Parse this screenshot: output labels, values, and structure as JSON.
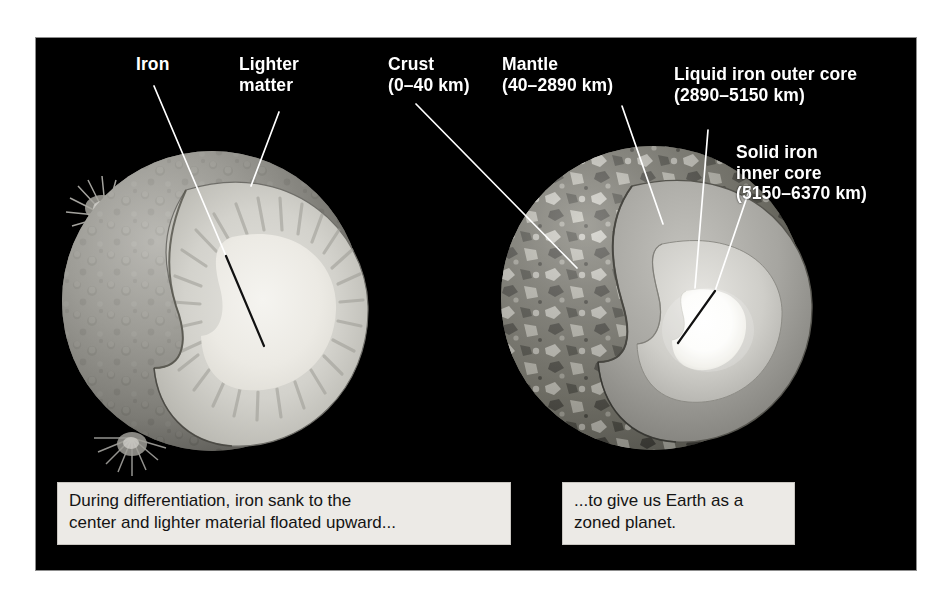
{
  "figure": {
    "background": "#ffffff",
    "panel_color": "#000000",
    "label_color": "#ffffff",
    "caption_bg": "#eceae6",
    "caption_text_color": "#141414"
  },
  "left_diagram": {
    "name": "differentiating-proto-earth",
    "labels": [
      {
        "id": "iron",
        "text": "Iron",
        "x": 100,
        "y": 24
      },
      {
        "id": "lighter-matter",
        "text": "Lighter\nmatter",
        "x": 203,
        "y": 24
      }
    ],
    "caption": "During differentiation, iron sank to the\ncenter and lighter material floated upward...",
    "layers": [
      {
        "name": "molten-cratered-surface",
        "color": "#8f8f8f"
      },
      {
        "name": "radial-streaked-mantle",
        "color": "#c9c9c4"
      },
      {
        "name": "bright-iron-core",
        "color": "#e9e9e4"
      }
    ]
  },
  "right_diagram": {
    "name": "zoned-earth",
    "labels": [
      {
        "id": "crust",
        "text": "Crust\n(0–40 km)",
        "x": 352,
        "y": 24
      },
      {
        "id": "mantle",
        "text": "Mantle\n(40–2890 km)",
        "x": 466,
        "y": 24
      },
      {
        "id": "outer-core",
        "text": "Liquid iron outer core\n(2890–5150 km)",
        "x": 638,
        "y": 32
      },
      {
        "id": "inner-core",
        "text": "Solid iron\ninner core\n(5150–6370 km)",
        "x": 700,
        "y": 110
      }
    ],
    "caption": "...to give us Earth as a\nzoned planet.",
    "layers": [
      {
        "name": "crust",
        "range_km": "0–40",
        "color": "#9a9a9a"
      },
      {
        "name": "mantle",
        "range_km": "40–2890",
        "color": "#a8a8a8"
      },
      {
        "name": "liquid-iron-outer-core",
        "range_km": "2890–5150",
        "color": "#d4d4d0"
      },
      {
        "name": "solid-iron-inner-core",
        "range_km": "5150–6370",
        "color": "#ffffff"
      }
    ]
  }
}
